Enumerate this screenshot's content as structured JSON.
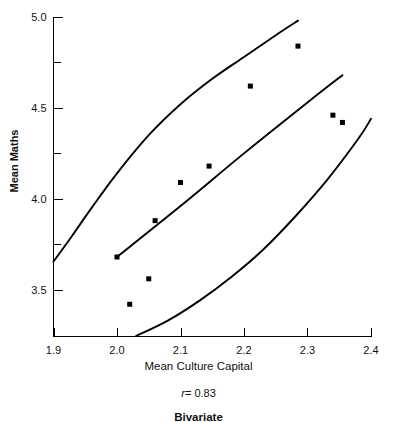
{
  "chart_data": {
    "type": "scatter",
    "title": "",
    "xlabel": "Mean Culture Capital",
    "ylabel": "Mean Maths",
    "xlim": [
      1.9,
      2.4
    ],
    "ylim": [
      3.24,
      5.0
    ],
    "grid": false,
    "legend": "none",
    "x_ticks": [
      "1.9",
      "2.0",
      "2.1",
      "2.2",
      "2.3",
      "2.4"
    ],
    "x_tick_values": [
      1.9,
      2.0,
      2.1,
      2.2,
      2.3,
      2.4
    ],
    "y_ticks": [
      "5.0",
      "4.5",
      "4.0",
      "3.5"
    ],
    "y_tick_values": [
      5.0,
      4.5,
      4.0,
      3.5
    ],
    "y_minor_tick_values": [
      4.75,
      4.25,
      3.75
    ],
    "points": [
      {
        "x": 2.0,
        "y": 3.68
      },
      {
        "x": 2.02,
        "y": 3.42
      },
      {
        "x": 2.05,
        "y": 3.56
      },
      {
        "x": 2.06,
        "y": 3.88
      },
      {
        "x": 2.1,
        "y": 4.09
      },
      {
        "x": 2.145,
        "y": 4.18
      },
      {
        "x": 2.21,
        "y": 4.62
      },
      {
        "x": 2.285,
        "y": 4.84
      },
      {
        "x": 2.34,
        "y": 4.46
      },
      {
        "x": 2.355,
        "y": 4.42
      }
    ],
    "curves": [
      {
        "name": "upper-confidence-band",
        "points": [
          {
            "x": 1.9,
            "y": 3.655
          },
          {
            "x": 1.93,
            "y": 3.8
          },
          {
            "x": 1.96,
            "y": 3.95
          },
          {
            "x": 2.0,
            "y": 4.14
          },
          {
            "x": 2.05,
            "y": 4.35
          },
          {
            "x": 2.1,
            "y": 4.52
          },
          {
            "x": 2.15,
            "y": 4.66
          },
          {
            "x": 2.2,
            "y": 4.78
          },
          {
            "x": 2.25,
            "y": 4.9
          },
          {
            "x": 2.285,
            "y": 4.98
          }
        ]
      },
      {
        "name": "regression-line",
        "points": [
          {
            "x": 2.0,
            "y": 3.68
          },
          {
            "x": 2.1,
            "y": 3.96
          },
          {
            "x": 2.2,
            "y": 4.25
          },
          {
            "x": 2.3,
            "y": 4.53
          },
          {
            "x": 2.355,
            "y": 4.68
          }
        ]
      },
      {
        "name": "lower-confidence-band",
        "points": [
          {
            "x": 2.03,
            "y": 3.245
          },
          {
            "x": 2.08,
            "y": 3.33
          },
          {
            "x": 2.13,
            "y": 3.44
          },
          {
            "x": 2.18,
            "y": 3.57
          },
          {
            "x": 2.23,
            "y": 3.72
          },
          {
            "x": 2.28,
            "y": 3.9
          },
          {
            "x": 2.33,
            "y": 4.1
          },
          {
            "x": 2.38,
            "y": 4.33
          },
          {
            "x": 2.4,
            "y": 4.44
          }
        ]
      }
    ],
    "annotations": {
      "correlation_symbol": "r",
      "correlation_equals": "=",
      "correlation_value": "0.83",
      "correlation_text": "r = 0.83"
    }
  },
  "caption": {
    "text": "Bivariate"
  }
}
